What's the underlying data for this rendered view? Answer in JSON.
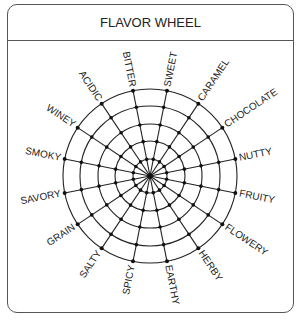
{
  "header": {
    "title": "FLAVOR WHEEL"
  },
  "wheel": {
    "center": [
      150,
      176
    ],
    "rings": [
      17,
      35,
      52,
      70,
      87
    ],
    "start_angle_deg": -101.25,
    "step_deg": 22.5,
    "line_color": "#222222",
    "labels": [
      "BITTER",
      "SWEET",
      "CARAMEL",
      "CHOCOLATE",
      "NUTTY",
      "FRUITY",
      "FLOWERY",
      "HERBY",
      "EARTHY",
      "SPICY",
      "SALTY",
      "GRAIN",
      "SAVORY",
      "SMOKY",
      "WINEY",
      "ACIDIC"
    ]
  }
}
